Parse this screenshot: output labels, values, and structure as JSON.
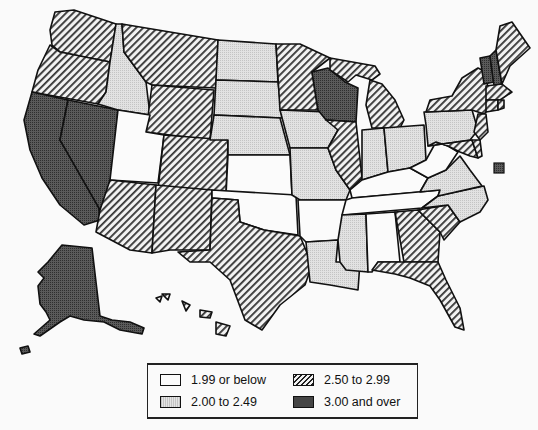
{
  "legend": {
    "items": [
      {
        "id": "c1",
        "label": "1.99 or below",
        "fill": "url(#pWhite)"
      },
      {
        "id": "c2",
        "label": "2.00 to 2.49",
        "fill": "url(#pLight)"
      },
      {
        "id": "c3",
        "label": "2.50 to 2.99",
        "fill": "url(#pHatch)"
      },
      {
        "id": "c4",
        "label": "3.00 and over",
        "fill": "url(#pDark)"
      }
    ]
  },
  "map": {
    "categories": {
      "WA": "c3",
      "OR": "c3",
      "CA": "c4",
      "NV": "c4",
      "ID": "c2",
      "MT": "c3",
      "WY": "c3",
      "UT": "c1",
      "AZ": "c3",
      "CO": "c3",
      "NM": "c3",
      "ND": "c2",
      "SD": "c2",
      "NE": "c2",
      "KS": "c1",
      "OK": "c1",
      "TX": "c3",
      "MN": "c3",
      "IA": "c2",
      "MO": "c2",
      "AR": "c1",
      "LA": "c2",
      "WI": "c4",
      "IL": "c3",
      "MI": "c3",
      "IN": "c2",
      "OH": "c2",
      "KY": "c1",
      "TN": "c1",
      "MS": "c2",
      "AL": "c1",
      "GA": "c3",
      "FL": "c3",
      "SC": "c3",
      "NC": "c2",
      "VA": "c2",
      "WV": "c1",
      "PA": "c2",
      "NY": "c3",
      "VT": "c4",
      "NH": "c4",
      "ME": "c3",
      "MA": "c3",
      "CT": "c3",
      "RI": "c3",
      "NJ": "c3",
      "DE": "c3",
      "MD": "c3",
      "DC": "c4",
      "AK": "c4",
      "HI": "c3"
    }
  }
}
